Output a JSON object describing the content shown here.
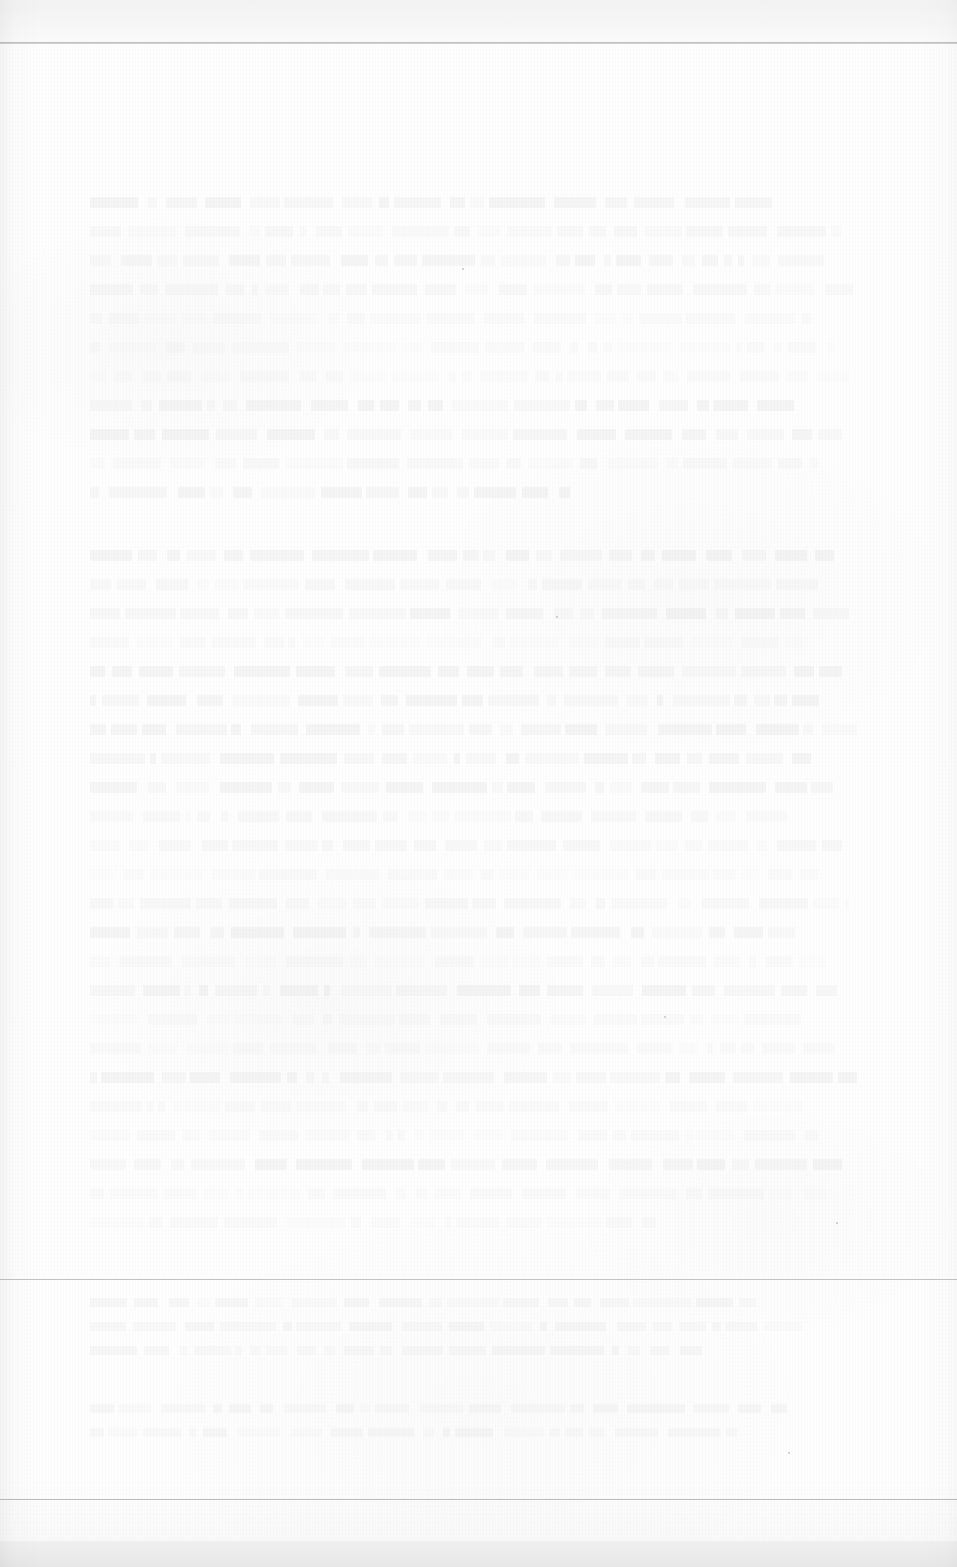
{
  "document": {
    "kind": "scanned-page",
    "page_condition": "faded, washed-out scan; body text is illegible ghosting",
    "background_color": "#fefefe",
    "ink_color": "#60646e",
    "rule_color": "#c3c3c3",
    "header_rule_color": "#b9b9b9",
    "width_px": 957,
    "height_px": 1567
  },
  "header": {
    "band_label": "",
    "rule_label": "",
    "running_head": "",
    "page_number": ""
  },
  "body": {
    "paragraphs": [
      {
        "id": "paragraph-1",
        "text": "",
        "legible": false,
        "line_widths": [
          88,
          97,
          95,
          99,
          93,
          96,
          98,
          91,
          97,
          94,
          62
        ]
      },
      {
        "id": "paragraph-2",
        "text": "",
        "legible": false,
        "line_widths": [
          96,
          94,
          98,
          92,
          97,
          95,
          99,
          93,
          96,
          90,
          97,
          94,
          98,
          91,
          95,
          97,
          93,
          96,
          99,
          92,
          94,
          97,
          95,
          73
        ]
      }
    ]
  },
  "footnotes": {
    "separator_label": "",
    "entries": [
      {
        "id": "footnote-1",
        "text": "",
        "legible": false,
        "line_widths": [
          86,
          92,
          79
        ]
      },
      {
        "id": "footnote-2",
        "text": "",
        "legible": false,
        "line_widths": [
          90,
          84
        ]
      }
    ]
  },
  "footer": {
    "text": "",
    "page_number": ""
  }
}
